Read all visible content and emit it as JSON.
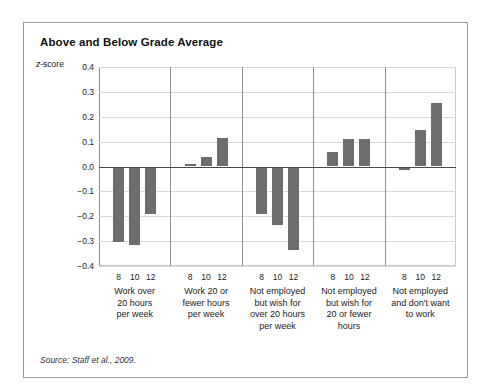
{
  "figure": {
    "title": "Above and Below Grade Average",
    "source_note": "Source: Staff et al., 2009."
  },
  "chart_data": {
    "type": "bar",
    "title": "Above and Below Grade Average",
    "xlabel": "",
    "ylabel": "z-score",
    "ylim": [
      -0.4,
      0.4
    ],
    "yticks": [
      0.4,
      0.3,
      0.2,
      0.1,
      0.0,
      -0.1,
      -0.2,
      -0.3,
      -0.4
    ],
    "ytick_labels": [
      "0.4",
      "0.3",
      "0.2",
      "0.1",
      "0.0",
      "−0.1",
      "−0.2",
      "−0.3",
      "−0.4"
    ],
    "grid": true,
    "legend": "none",
    "bar_color": "#6d6d6d",
    "subgroup_label": "grade",
    "subgroups": [
      "8",
      "10",
      "12"
    ],
    "categories": [
      "Work over 20 hours per week",
      "Work 20 or fewer hours per week",
      "Not employed but wish for over 20 hours per week",
      "Not employed but wish for 20 or fewer hours",
      "Not employed and don't want to work"
    ],
    "category_label_lines": [
      [
        "Work over",
        "20 hours",
        "per week"
      ],
      [
        "Work 20 or",
        "fewer hours",
        "per week"
      ],
      [
        "Not employed",
        "but wish for",
        "over 20 hours",
        "per week"
      ],
      [
        "Not employed",
        "but wish for",
        "20 or fewer",
        "hours"
      ],
      [
        "Not employed",
        "and don't want",
        "to work"
      ]
    ],
    "series": [
      {
        "name": "8",
        "values": [
          -0.305,
          0.01,
          -0.19,
          0.06,
          -0.015
        ]
      },
      {
        "name": "10",
        "values": [
          -0.315,
          0.04,
          -0.235,
          0.11,
          0.145
        ]
      },
      {
        "name": "12",
        "values": [
          -0.19,
          0.115,
          -0.335,
          0.11,
          0.255
        ]
      }
    ],
    "groups": [
      {
        "category_index": 0,
        "bars": [
          {
            "grade": "8",
            "value": -0.305
          },
          {
            "grade": "10",
            "value": -0.315
          },
          {
            "grade": "12",
            "value": -0.19
          }
        ]
      },
      {
        "category_index": 1,
        "bars": [
          {
            "grade": "8",
            "value": 0.01
          },
          {
            "grade": "10",
            "value": 0.04
          },
          {
            "grade": "12",
            "value": 0.115
          }
        ]
      },
      {
        "category_index": 2,
        "bars": [
          {
            "grade": "8",
            "value": -0.19
          },
          {
            "grade": "10",
            "value": -0.235
          },
          {
            "grade": "12",
            "value": -0.335
          }
        ]
      },
      {
        "category_index": 3,
        "bars": [
          {
            "grade": "8",
            "value": 0.06
          },
          {
            "grade": "10",
            "value": 0.11
          },
          {
            "grade": "12",
            "value": 0.11
          }
        ]
      },
      {
        "category_index": 4,
        "bars": [
          {
            "grade": "8",
            "value": -0.015
          },
          {
            "grade": "10",
            "value": 0.145
          },
          {
            "grade": "12",
            "value": 0.255
          }
        ]
      }
    ]
  }
}
